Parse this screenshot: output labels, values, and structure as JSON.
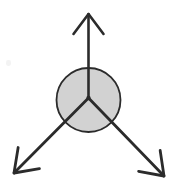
{
  "figure": {
    "canvas": {
      "width": 176,
      "height": 190,
      "background": "#ffffff"
    }
  },
  "colors": {
    "stroke": "#2b2b2b",
    "body_fill": "#d2d2d2",
    "body_outline": "#2b2b2b",
    "background": "#ffffff",
    "smudge": "#f2f2f2"
  },
  "body": {
    "label": "circular-body",
    "shape": "circle",
    "center_x": 88.5,
    "center_y": 100,
    "radius": 32,
    "fill": "#d2d2d2",
    "stroke_width": 1.8
  },
  "origin": {
    "label": "application-point",
    "x": 88.5,
    "y": 98,
    "dot_radius": 2.2
  },
  "vectors": [
    {
      "name": "up-vector",
      "label": "",
      "direction": "up",
      "angle_deg": 90,
      "start_x": 88.5,
      "start_y": 98,
      "tip_x": 88.5,
      "tip_y": 14,
      "length": 84,
      "stroke_width": 2.6,
      "arrowhead": {
        "style": "open-chevron",
        "half_width": 15,
        "depth": 20
      }
    },
    {
      "name": "down-left-vector",
      "label": "",
      "direction": "down-left",
      "angle_deg": 217,
      "start_x": 88.5,
      "start_y": 98,
      "tip_x": 14,
      "tip_y": 173,
      "length": 105.7,
      "stroke_width": 2.8,
      "arrowhead": {
        "style": "open-chevron",
        "half_width": 15,
        "depth": 21
      }
    },
    {
      "name": "down-right-vector",
      "label": "",
      "direction": "down-right",
      "angle_deg": 323,
      "start_x": 88.5,
      "start_y": 98,
      "tip_x": 164,
      "tip_y": 176,
      "length": 108.5,
      "stroke_width": 2.8,
      "arrowhead": {
        "style": "open-chevron",
        "half_width": 15,
        "depth": 21
      }
    }
  ],
  "artifacts": [
    {
      "name": "scan-smudge",
      "x": 6,
      "y": 60,
      "width": 5,
      "height": 6
    }
  ],
  "chart_data": {
    "type": "scatter",
    "xlabel": "",
    "ylabel": "",
    "categories": [
      "up-vector",
      "down-left-vector",
      "down-right-vector"
    ],
    "values": [
      84,
      105.7,
      108.5
    ],
    "angles_deg": [
      90,
      217,
      323
    ],
    "grid": false,
    "legend": "none"
  }
}
